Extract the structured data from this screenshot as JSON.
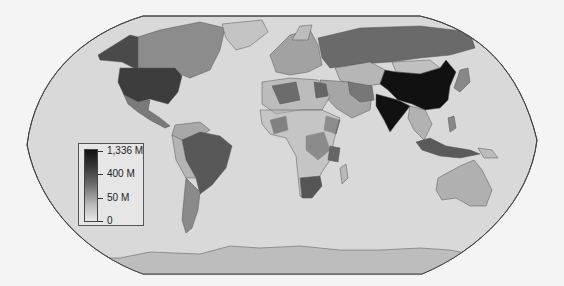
{
  "map": {
    "projection": "Robinson",
    "style": "grayscale choropleth of world countries",
    "colors": {
      "background": "#f4f4f4",
      "ocean": "#d9d9d9",
      "outline": "#444444",
      "country_border": "#555555",
      "no_data_land": "#c8c8c8",
      "scale_min": "#e8e8e8",
      "scale_max": "#111111"
    },
    "highlighted_regions": [
      {
        "name": "China",
        "shade": "#111111"
      },
      {
        "name": "India",
        "shade": "#111111"
      },
      {
        "name": "United States",
        "shade": "#3c3c3c"
      },
      {
        "name": "Brazil",
        "shade": "#585858"
      },
      {
        "name": "Russia",
        "shade": "#6a6a6a"
      },
      {
        "name": "Indonesia",
        "shade": "#5a5a5a"
      },
      {
        "name": "Mexico",
        "shade": "#7a7a7a"
      },
      {
        "name": "Canada",
        "shade": "#8c8c8c"
      },
      {
        "name": "Australia",
        "shade": "#b0b0b0"
      },
      {
        "name": "Antarctica",
        "shade": "#bdbdbd"
      }
    ]
  },
  "legend": {
    "labels": [
      "1,336 M",
      "400 M",
      "50 M",
      "0"
    ],
    "max_label": "1,336 M",
    "mid_high_label": "400 M",
    "mid_low_label": "50 M",
    "min_label": "0"
  }
}
